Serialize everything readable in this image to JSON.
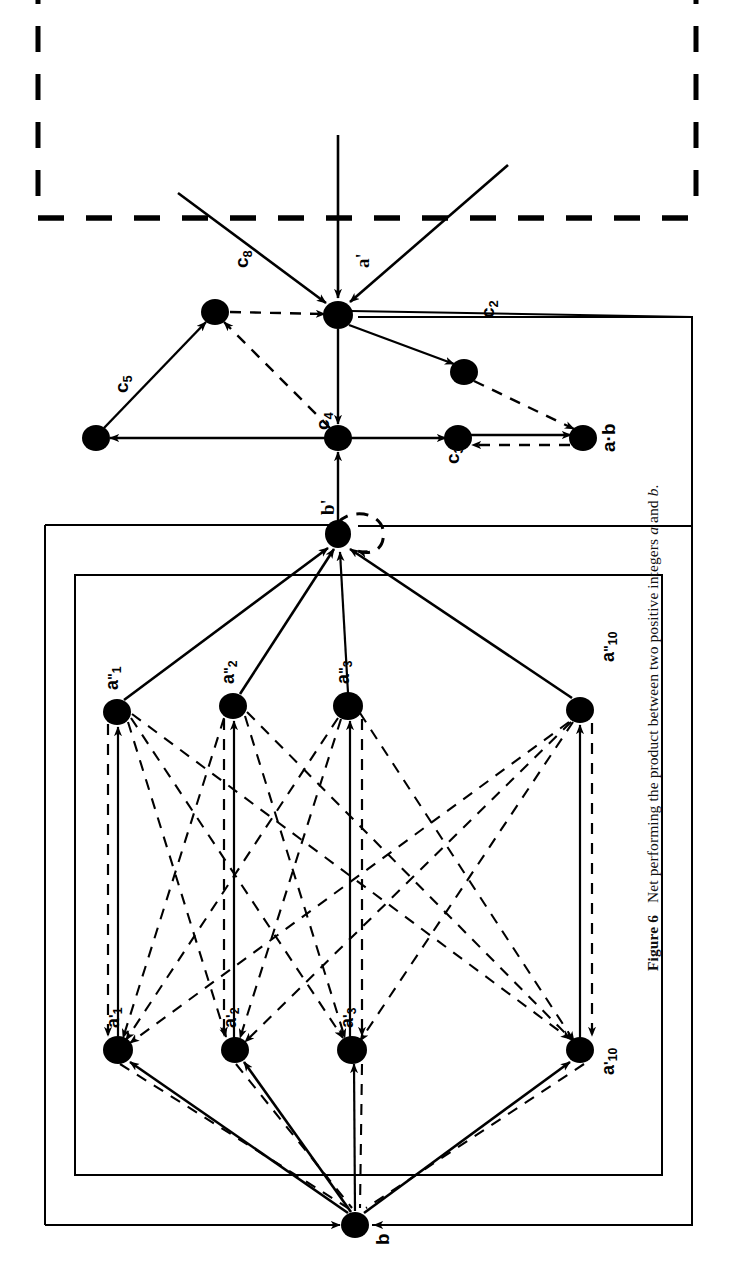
{
  "figure": {
    "number_label": "Figure 6",
    "caption": "Net performing the product between two positive integers a and b.",
    "caption_pre": "Net performing the product between two positive integers ",
    "caption_var_a": "a",
    "caption_mid": " and ",
    "caption_var_b": "b",
    "caption_end": "."
  },
  "colors": {
    "ink": "#000000",
    "paper": "#ffffff"
  },
  "diagram": {
    "title": "Net performing the product between two positive integers a and b",
    "orientation": "rotated-90-ccw",
    "node_radius": 13,
    "nodes": [
      {
        "id": "a_out",
        "label": "a'",
        "base": "a",
        "prime": "'",
        "sub": "",
        "x": 338,
        "y": 315
      },
      {
        "id": "c8",
        "label": "c8",
        "base": "c",
        "prime": "",
        "sub": "8",
        "x": 215,
        "y": 312
      },
      {
        "id": "c2",
        "label": "c2",
        "base": "c",
        "prime": "",
        "sub": "2",
        "x": 464,
        "y": 372
      },
      {
        "id": "c5",
        "label": "c5",
        "base": "c",
        "prime": "",
        "sub": "5",
        "x": 96,
        "y": 438
      },
      {
        "id": "c4",
        "label": "c4",
        "base": "c",
        "prime": "",
        "sub": "4",
        "x": 338,
        "y": 438
      },
      {
        "id": "c3",
        "label": "c3",
        "base": "c",
        "prime": "",
        "sub": "3",
        "x": 458,
        "y": 438
      },
      {
        "id": "ab",
        "label": "a·b",
        "base": "ab",
        "prime": "",
        "sub": "",
        "x": 583,
        "y": 438
      },
      {
        "id": "b_out",
        "label": "b'",
        "base": "b",
        "prime": "'",
        "sub": "",
        "x": 338,
        "y": 534
      },
      {
        "id": "app1",
        "label": "a''1",
        "base": "a",
        "prime": "\"",
        "sub": "1",
        "x": 117,
        "y": 712
      },
      {
        "id": "app2",
        "label": "a''2",
        "base": "a",
        "prime": "\"",
        "sub": "2",
        "x": 233,
        "y": 706
      },
      {
        "id": "app3",
        "label": "a''3",
        "base": "a",
        "prime": "\"",
        "sub": "3",
        "x": 348,
        "y": 706
      },
      {
        "id": "app10",
        "label": "a''10",
        "base": "a",
        "prime": "\"",
        "sub": "10",
        "x": 580,
        "y": 710
      },
      {
        "id": "ap1",
        "label": "a'1",
        "base": "a",
        "prime": "'",
        "sub": "1",
        "x": 118,
        "y": 1050
      },
      {
        "id": "ap2",
        "label": "a'2",
        "base": "a",
        "prime": "'",
        "sub": "2",
        "x": 235,
        "y": 1050
      },
      {
        "id": "ap3",
        "label": "a'3",
        "base": "a",
        "prime": "'",
        "sub": "3",
        "x": 352,
        "y": 1050
      },
      {
        "id": "ap10",
        "label": "a'10",
        "base": "a",
        "prime": "'",
        "sub": "10",
        "x": 580,
        "y": 1050
      },
      {
        "id": "b_in",
        "label": "b",
        "base": "b",
        "prime": "",
        "sub": "",
        "x": 355,
        "y": 1225
      }
    ],
    "labels": [
      {
        "id": "lbl-a-out",
        "text": "a'",
        "x": 352,
        "y": 268,
        "rot": -90
      },
      {
        "id": "lbl-c8",
        "text": "c8",
        "x": 230,
        "y": 268,
        "rot": -90
      },
      {
        "id": "lbl-c2",
        "text": "c2",
        "x": 476,
        "y": 316,
        "rot": -90
      },
      {
        "id": "lbl-c5",
        "text": "c5",
        "x": 110,
        "y": 392,
        "rot": -90
      },
      {
        "id": "lbl-c4",
        "text": "c4",
        "x": 310,
        "y": 430,
        "rot": -90
      },
      {
        "id": "lbl-c3",
        "text": "c3",
        "x": 440,
        "y": 462,
        "rot": -90
      },
      {
        "id": "lbl-ab",
        "text": "a·b",
        "x": 596,
        "y": 450,
        "rot": -90
      },
      {
        "id": "lbl-b-out",
        "text": "b'",
        "x": 316,
        "y": 514,
        "rot": -90
      },
      {
        "id": "lbl-app1",
        "text": "a''1",
        "x": 102,
        "y": 688,
        "rot": -90
      },
      {
        "id": "lbl-app2",
        "text": "a''2",
        "x": 218,
        "y": 682,
        "rot": -90
      },
      {
        "id": "lbl-app3",
        "text": "a''3",
        "x": 333,
        "y": 682,
        "rot": -90
      },
      {
        "id": "lbl-app10",
        "text": "a''10",
        "x": 596,
        "y": 662,
        "rot": -90
      },
      {
        "id": "lbl-ap1",
        "text": "a'1",
        "x": 103,
        "y": 1026,
        "rot": -90
      },
      {
        "id": "lbl-ap2",
        "text": "a'2",
        "x": 220,
        "y": 1026,
        "rot": -90
      },
      {
        "id": "lbl-ap3",
        "text": "a'3",
        "x": 337,
        "y": 1026,
        "rot": -90
      },
      {
        "id": "lbl-ap10",
        "text": "a'10",
        "x": 596,
        "y": 1070,
        "rot": -90
      },
      {
        "id": "lbl-b-in",
        "text": "b",
        "x": 370,
        "y": 1240,
        "rot": -90
      }
    ],
    "regions": [
      {
        "id": "dashed-boundary",
        "style": "dashed",
        "x": 38,
        "y": -60,
        "w": 658,
        "h": 280
      },
      {
        "id": "outer-box",
        "style": "solid",
        "x": 45,
        "y": 525,
        "w": 647,
        "h": 700
      },
      {
        "id": "inner-box",
        "style": "solid",
        "x": 75,
        "y": 575,
        "w": 587,
        "h": 600
      },
      {
        "id": "product-box",
        "style": "solid",
        "x": 358,
        "y": 318,
        "w": 334,
        "h": 208
      }
    ]
  }
}
